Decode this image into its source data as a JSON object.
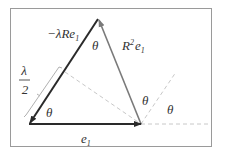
{
  "diagram": {
    "labels": {
      "neg_lambda_R_e1": "−λRe",
      "neg_lambda_R_e1_sub": "1",
      "R2_e1_base": "R",
      "R2_e1_sup": "2",
      "R2_e1_e": "e",
      "R2_e1_sub": "1",
      "e1": "e",
      "e1_sub": "1",
      "lambda": "λ",
      "two": "2",
      "theta_top": "θ",
      "theta_bottom_left": "θ",
      "theta_right_inner": "θ",
      "theta_right_outer": "θ"
    },
    "colors": {
      "frame": "#9a9a9a",
      "dark_arrow": "#2a2a2a",
      "gray_arrow": "#7a7a7a",
      "dashed": "#c8c8c8",
      "bracket": "#b0b0b0"
    }
  }
}
